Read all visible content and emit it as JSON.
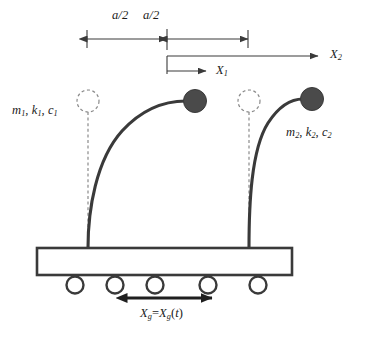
{
  "figure": {
    "colors": {
      "stroke": "#3a3a3a",
      "mass_fill": "#4a4a4a",
      "dashed": "#8a8a8a",
      "text": "#1a1a1a",
      "background": "#ffffff"
    },
    "dimension_labels": {
      "left_segment": "a/2",
      "right_segment": "a/2"
    },
    "displacement_labels": {
      "inner": {
        "base": "X",
        "sub": "1"
      },
      "outer": {
        "base": "X",
        "sub": "2"
      }
    },
    "property_labels": {
      "structure_1": {
        "mass": "m",
        "stiffness": "k",
        "damping": "c",
        "sub": "1",
        "text": "m1, k1, c1"
      },
      "structure_2": {
        "mass": "m",
        "stiffness": "k",
        "damping": "c",
        "sub": "2",
        "text": "m2, k2, c2"
      }
    },
    "ground_motion": {
      "base": "X",
      "sub": "g",
      "equals": "=",
      "function_arg": "t",
      "text": "Xg=Xg(t)"
    },
    "elements": {
      "platform": "rigid-base-platform",
      "rollers_count": 5,
      "structures": 2,
      "undeformed_markers": 2
    }
  }
}
